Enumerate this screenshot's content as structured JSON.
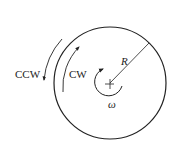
{
  "diagram": {
    "type": "rotating-disk",
    "colors": {
      "stroke": "#222222",
      "background": "#ffffff"
    },
    "circle": {
      "cx": 110,
      "cy": 83,
      "r": 56
    },
    "labels": {
      "ccw": "CCW",
      "cw": "CW",
      "radius": "R",
      "angular_velocity": "ω"
    }
  }
}
